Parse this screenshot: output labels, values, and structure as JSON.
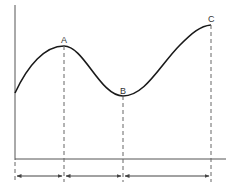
{
  "diagram": {
    "type": "cycle-curve",
    "colors": {
      "curve": "#1a1a1a",
      "axis": "#555555",
      "dashed": "#666666",
      "label": "#333333"
    },
    "points": [
      {
        "label": "A",
        "x": 64,
        "y": 46
      },
      {
        "label": "B",
        "x": 123,
        "y": 96
      },
      {
        "label": "C",
        "x": 211,
        "y": 25
      }
    ],
    "curve_start": {
      "x": 15,
      "y": 93
    },
    "axes": {
      "y_axis": {
        "x": 15,
        "y1": 5,
        "y2": 160
      },
      "x_axis": {
        "y": 159,
        "x1": 15,
        "x2": 226
      }
    },
    "interval_arrows": [
      {
        "from": "origin",
        "to": "A"
      },
      {
        "from": "A",
        "to": "B"
      },
      {
        "from": "B",
        "to": "C"
      }
    ]
  }
}
